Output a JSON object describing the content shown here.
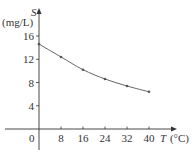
{
  "chart_data": {
    "type": "line",
    "title": "",
    "xlabel": "T (°C)",
    "xlabel_var": "T",
    "xlabel_unit": "(°C)",
    "ylabel": "S (mg/L)",
    "ylabel_var": "S",
    "ylabel_unit": "(mg/L)",
    "x": [
      0,
      8,
      16,
      24,
      32,
      40
    ],
    "series": [
      {
        "name": "S",
        "values": [
          14.6,
          12.4,
          10.2,
          8.6,
          7.4,
          6.4
        ]
      }
    ],
    "x_ticks": [
      8,
      16,
      24,
      32,
      40
    ],
    "y_ticks": [
      4,
      8,
      12,
      16
    ],
    "origin_label": "0",
    "xlim": [
      0,
      48
    ],
    "ylim": [
      0,
      19
    ],
    "grid": false,
    "legend": "none",
    "colors": {
      "axis": "#333333",
      "line": "#666666",
      "marker": "#555555"
    }
  }
}
